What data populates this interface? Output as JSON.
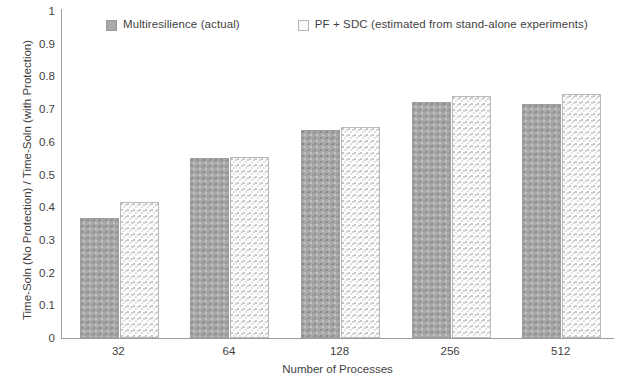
{
  "chart_data": {
    "type": "bar",
    "title": "",
    "xlabel": "Number of Processes",
    "ylabel": "Time-Soln (No Protection) / Time-Soln (with Protection)",
    "categories": [
      "32",
      "64",
      "128",
      "256",
      "512"
    ],
    "series": [
      {
        "name": "Multiresilience (actual)",
        "values": [
          0.36,
          0.545,
          0.63,
          0.715,
          0.71
        ],
        "color": "#a9a9a9",
        "pattern": "dotted-gray-fill"
      },
      {
        "name": "PF + SDC (estimated from stand-alone experiments)",
        "values": [
          0.41,
          0.548,
          0.638,
          0.735,
          0.74
        ],
        "color": "#fcfcfc",
        "pattern": "light-speckle-fill"
      }
    ],
    "ylim": [
      0,
      1
    ],
    "y_ticks": [
      "0",
      "0.1",
      "0.2",
      "0.3",
      "0.4",
      "0.5",
      "0.6",
      "0.7",
      "0.8",
      "0.9",
      "1"
    ],
    "y_tick_values": [
      0,
      0.1,
      0.2,
      0.3,
      0.4,
      0.5,
      0.6,
      0.7,
      0.8,
      0.9,
      1
    ],
    "grid": false,
    "legend_position": "top"
  },
  "legend": {
    "entries": [
      {
        "label": "Multiresilience (actual)"
      },
      {
        "label": "PF + SDC (estimated from stand-alone experiments)"
      }
    ]
  },
  "axes": {
    "x_title": "Number of Processes",
    "y_title": "Time-Soln (No Protection) / Time-Soln (with Protection)"
  }
}
